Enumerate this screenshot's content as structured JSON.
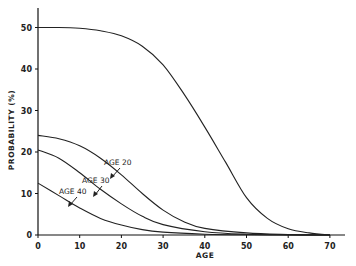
{
  "chart_data": {
    "type": "line",
    "title": "",
    "xlabel": "AGE",
    "ylabel": "PROBABILITY (%)",
    "xlim": [
      0,
      75
    ],
    "ylim": [
      0,
      53
    ],
    "xticks": [
      0,
      10,
      20,
      30,
      40,
      50,
      60,
      70
    ],
    "yticks": [
      0,
      10,
      20,
      30,
      40,
      50
    ],
    "grid": false,
    "legend": "none (inline annotations)",
    "series": [
      {
        "name": "Upper curve (unlabeled)",
        "x": [
          0,
          5,
          10,
          15,
          20,
          25,
          30,
          35,
          40,
          45,
          50,
          55,
          60,
          65,
          70
        ],
        "y": [
          50,
          50,
          49.8,
          49.2,
          48,
          45.5,
          41,
          34,
          26,
          17.5,
          9,
          4,
          1.5,
          0.5,
          0
        ]
      },
      {
        "name": "AGE 20",
        "x": [
          0,
          5,
          10,
          15,
          20,
          25,
          30,
          35,
          40,
          50,
          60,
          70
        ],
        "y": [
          24,
          23.2,
          21.5,
          18.5,
          14.5,
          10,
          6,
          3.2,
          1.6,
          0.5,
          0.1,
          0
        ]
      },
      {
        "name": "AGE 30",
        "x": [
          0,
          5,
          10,
          15,
          20,
          25,
          30,
          40,
          50,
          60,
          70
        ],
        "y": [
          20.5,
          18.5,
          15,
          11,
          7.5,
          4.5,
          2.5,
          0.8,
          0.2,
          0.05,
          0
        ]
      },
      {
        "name": "AGE 40",
        "x": [
          0,
          5,
          10,
          15,
          20,
          25,
          30,
          40,
          50,
          60,
          70
        ],
        "y": [
          12.5,
          9.5,
          6.5,
          4,
          2.4,
          1.3,
          0.7,
          0.2,
          0.05,
          0,
          0
        ]
      }
    ],
    "annotations": [
      {
        "text": "AGE 20",
        "points_to_series": "AGE 20"
      },
      {
        "text": "AGE 30",
        "points_to_series": "AGE 30"
      },
      {
        "text": "AGE 40",
        "points_to_series": "AGE 40"
      }
    ]
  },
  "labels": {
    "xlabel": "AGE",
    "ylabel": "PROBABILITY (%)",
    "annot_20": "AGE 20",
    "annot_30": "AGE 30",
    "annot_40": "AGE 40"
  },
  "ticks": {
    "x": [
      "0",
      "10",
      "20",
      "30",
      "40",
      "50",
      "60",
      "70"
    ],
    "y": [
      "0",
      "10",
      "20",
      "30",
      "40",
      "50"
    ]
  },
  "colors": {
    "line": "#222222",
    "background": "#ffffff"
  }
}
